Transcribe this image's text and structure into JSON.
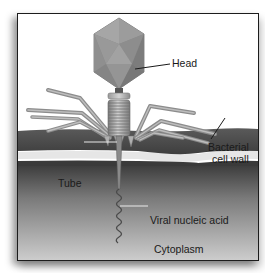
{
  "diagram": {
    "labels": {
      "head": "Head",
      "bacterial_cell_wall_line1": "Bacterial",
      "bacterial_cell_wall_line2": "cell wall",
      "tube": "Tube",
      "viral_nucleic_acid": "Viral nucleic acid",
      "cytoplasm": "Cytoplasm"
    },
    "colors": {
      "capsid": "#8a8a8a",
      "capsid_highlight": "#a9a9a9",
      "tail_fiber": "#9a9a9a",
      "cell_wall": "#4a4a4a",
      "membrane_gap": "#e6e6e6",
      "cytoplasm_top": "#3a3a3a",
      "cytoplasm_bottom": "#c9c9c9",
      "frame_border": "#1c1c1c"
    }
  }
}
